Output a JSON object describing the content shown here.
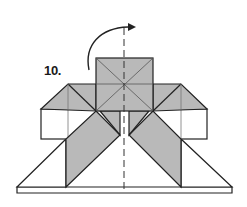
{
  "diagram": {
    "type": "origami-fold-instruction",
    "step_label": "10.",
    "colors": {
      "paper_colored": "#b9b9b9",
      "paper_white": "#ffffff",
      "line": "#222222",
      "crease": "#555555"
    },
    "elements": [
      {
        "name": "top-square",
        "description": "Square with diagonal creases at top center"
      },
      {
        "name": "left-wing",
        "description": "Triangular flap and box on left"
      },
      {
        "name": "right-wing",
        "description": "Triangular flap and box on right"
      },
      {
        "name": "left-diagonal-band",
        "description": "Gray diagonal band on left"
      },
      {
        "name": "right-diagonal-band",
        "description": "Gray diagonal band on right"
      },
      {
        "name": "base-triangle",
        "description": "White trapezoid base with bottom strip"
      },
      {
        "name": "fold-axis",
        "description": "Vertical dashed line marking fold axis"
      },
      {
        "name": "turn-over-arrow",
        "description": "Curved arrow indicating turn over"
      }
    ]
  }
}
